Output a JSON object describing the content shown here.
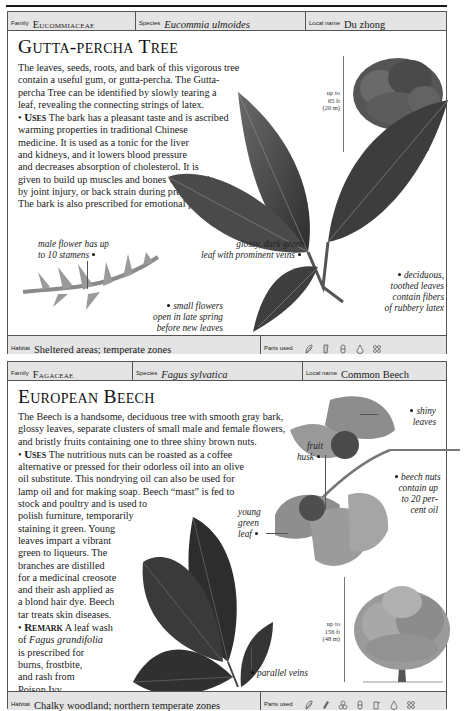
{
  "page": {
    "entries": [
      {
        "header": {
          "family_label": "Family",
          "family": "Eucommiaceae",
          "species_label": "Species",
          "species": "Eucommia ulmoides",
          "local_label": "Local name",
          "local_name": "Du zhong"
        },
        "title": "Gutta-percha Tree",
        "body_lines": [
          "The leaves, seeds, roots, and bark of this vigorous tree",
          "contain a useful gum, or gutta-percha. The Gutta-",
          "percha Tree can be identified by slowly tearing a",
          "leaf, revealing the connecting strings of latex."
        ],
        "uses_keyword": "Uses",
        "uses_lines": [
          " The bark has a pleasant taste and is ascribed",
          "warming properties in traditional Chinese",
          "medicine. It is used as a tonic for the liver",
          "and kidneys, and it lowers blood pressure",
          "and decreases absorption of cholesterol. It is",
          "given to build up muscles and bones weakened",
          "by joint injury, or back strain during pregnancy.",
          "The bark is also prescribed for emotional problems."
        ],
        "height": [
          "up to",
          "65 ft",
          "(20 m)"
        ],
        "captions": {
          "male_flower": [
            "male flower has up",
            "to 10 stamens"
          ],
          "small_flowers": [
            "small flowers",
            "open in late spring",
            "before new leaves"
          ],
          "glossy_leaf": [
            "glossy, dark green",
            "leaf with prominent veins"
          ],
          "deciduous": [
            "deciduous,",
            "toothed leaves",
            "contain fibers",
            "of rubbery latex"
          ]
        },
        "footer": {
          "habitat_label": "Habitat",
          "habitat": "Sheltered areas; temperate zones",
          "parts_label": "Parts used",
          "parts_icons": [
            "leaf-icon",
            "bark-icon",
            "seed-icon",
            "gum-drop-icon",
            "root-icon"
          ]
        }
      },
      {
        "header": {
          "family_label": "Family",
          "family": "Fagaceae",
          "species_label": "Species",
          "species": "Fagus sylvatica",
          "local_label": "Local name",
          "local_name": "Common Beech"
        },
        "title": "European Beech",
        "body_lines": [
          "The Beech is a handsome, deciduous tree with smooth gray bark,",
          "glossy leaves, separate clusters of small male and female flowers,",
          "and bristly fruits containing one to three shiny brown nuts."
        ],
        "uses_keyword": "Uses",
        "uses_lines": [
          " The nutritious nuts can be roasted as a coffee",
          "alternative or pressed for their odorless oil into an olive",
          "oil substitute. This nondrying oil can also be used for",
          "lamp oil and for making soap. Beech “mast” is fed to",
          "stock and poultry and is used to",
          "polish furniture, temporarily",
          "staining it green. Young",
          "leaves impart a vibrant",
          "green to liqueurs. The",
          "branches are distilled",
          "for a medicinal creosote",
          "and their ash applied as",
          "a blond hair dye. Beech",
          "tar treats skin diseases."
        ],
        "remark_keyword": "Remark",
        "remark_lines_pre": " A leaf wash",
        "remark_line2_pre": "of ",
        "remark_species": "Fagus grandifolia",
        "remark_lines": [
          "is prescribed for",
          "burns, frostbite,",
          "and rash from",
          "Poison Ivy."
        ],
        "height": [
          "up to",
          "156 ft",
          "(48 m)"
        ],
        "captions": {
          "shiny_leaves": [
            "shiny",
            "leaves"
          ],
          "fruit_husk": [
            "fruit",
            "husk"
          ],
          "beech_nuts": [
            "beech nuts",
            "contain up",
            "to 20 per-",
            "cent oil"
          ],
          "young_leaf": [
            "young",
            "green",
            "leaf"
          ],
          "parallel_veins": [
            "parallel veins"
          ]
        },
        "footer": {
          "habitat_label": "Habitat",
          "habitat": "Chalky woodland; northern temperate zones",
          "parts_label": "Parts used",
          "parts_icons": [
            "leaf-icon",
            "bark-icon",
            "flower-icon",
            "seed-icon",
            "nut-icon",
            "oil-drop-icon",
            "root-icon"
          ]
        }
      }
    ]
  }
}
